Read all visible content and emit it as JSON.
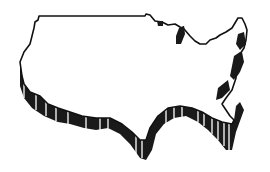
{
  "illustration": {
    "subject": "united-states-map",
    "style": "3d-extruded-outline",
    "colors": {
      "background": "#ffffff",
      "outline": "#111111",
      "extrusion": "#1a1a1a",
      "face": "#ffffff"
    }
  }
}
